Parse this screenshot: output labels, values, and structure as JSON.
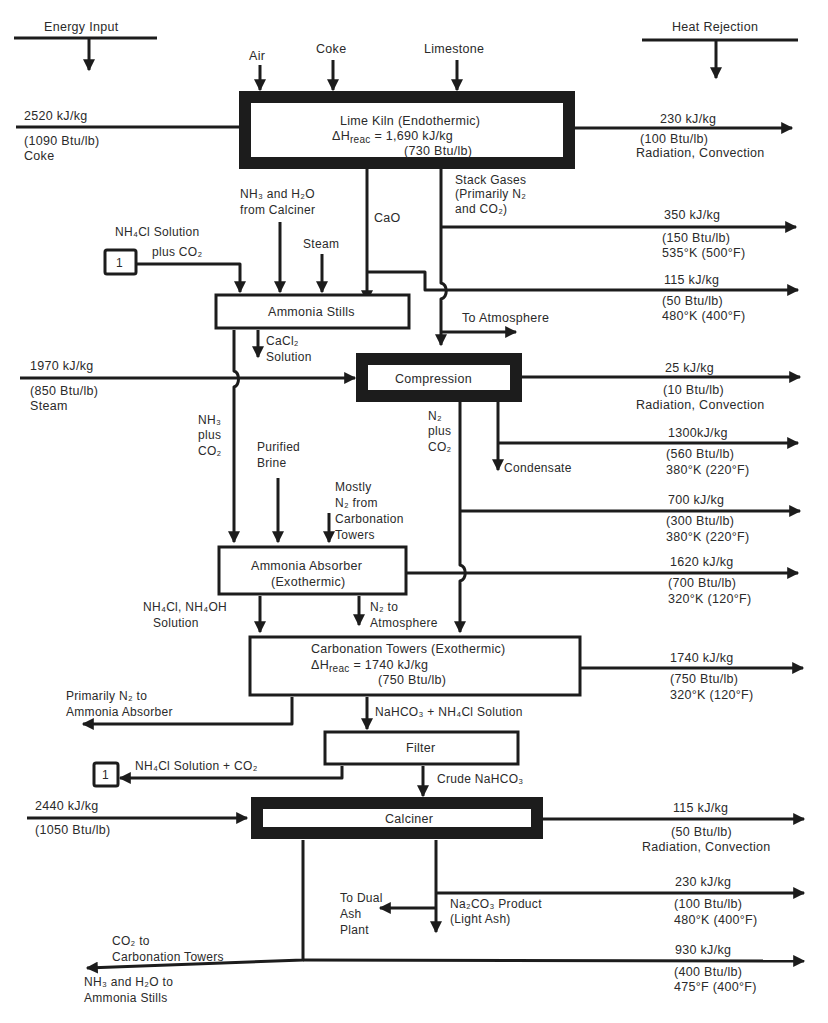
{
  "legend": {
    "energy_input": "Energy Input",
    "heat_rejection": "Heat Rejection"
  },
  "units": {
    "lime_kiln": {
      "title": "Lime Kiln (Endothermic)",
      "dh_prefix": "ΔH",
      "dh_sub": "reac",
      "dh_value": " = 1,690 kJ/kg",
      "dh_alt": "(730 Btu/lb)"
    },
    "ammonia_stills": {
      "title": "Ammonia Stills"
    },
    "compression": {
      "title": "Compression"
    },
    "ammonia_absorber": {
      "title": "Ammonia Absorber",
      "subtitle": "(Exothermic)"
    },
    "carbonation_towers": {
      "title": "Carbonation Towers (Exothermic)",
      "dh_prefix": "ΔH",
      "dh_sub": "reac",
      "dh_value": " = 1740 kJ/kg",
      "dh_alt": "(750 Btu/lb)"
    },
    "filter": {
      "title": "Filter"
    },
    "calciner": {
      "title": "Calciner"
    }
  },
  "inputs": {
    "air": "Air",
    "coke": "Coke",
    "limestone": "Limestone",
    "kiln_energy": {
      "kj": "2520 kJ/kg",
      "btu": "(1090 Btu/lb)",
      "source": "Coke"
    },
    "compression_energy": {
      "kj": "1970 kJ/kg",
      "btu": "(850 Btu/lb)",
      "source": "Steam"
    },
    "calciner_energy": {
      "kj": "2440 kJ/kg",
      "btu": "(1050 Btu/lb)"
    }
  },
  "streams": {
    "nh3_h2o_from_calciner": [
      "NH₃ and H₂O",
      "from Calciner"
    ],
    "cao": "CaO",
    "steam": "Steam",
    "nh4cl_plus_co2": [
      "NH₄Cl Solution",
      "plus CO₂"
    ],
    "stack_gases": [
      "Stack Gases",
      "(Primarily N₂",
      "and CO₂)"
    ],
    "to_atmosphere": "To Atmosphere",
    "cacl2_solution": [
      "CaCl₂",
      "Solution"
    ],
    "nh3_plus_co2": [
      "NH₃",
      "plus",
      "CO₂"
    ],
    "n2_plus_co2": [
      "N₂",
      "plus",
      "CO₂"
    ],
    "condensate": "Condensate",
    "purified_brine": [
      "Purified",
      "Brine"
    ],
    "mostly_n2": [
      "Mostly",
      "N₂ from",
      "Carbonation",
      "Towers"
    ],
    "nh4cl_nh4oh": [
      "NH₄Cl, NH₄OH",
      "Solution"
    ],
    "n2_to_atmosphere": [
      "N₂ to",
      "Atmosphere"
    ],
    "primarily_n2_to_absorber": [
      "Primarily N₂ to",
      "Ammonia Absorber"
    ],
    "nahco3_nh4cl": "NaHCO₃ + NH₄Cl Solution",
    "nh4cl_solution_co2": "NH₄Cl Solution + CO₂",
    "crude_nahco3": "Crude NaHCO₃",
    "to_dual_ash": [
      "To Dual",
      "Ash",
      "Plant"
    ],
    "na2co3_product": [
      "Na₂CO₃ Product",
      "(Light Ash)"
    ],
    "co2_to_carbonation": [
      "CO₂ to",
      "Carbonation Towers"
    ],
    "nh3_h2o_to_stills": [
      "NH₃ and H₂O to",
      "Ammonia Stills"
    ],
    "ref_marker": "1"
  },
  "heat_rejections": [
    {
      "kj": "230 kJ/kg",
      "btu": "(100 Btu/lb)",
      "detail": "Radiation, Convection"
    },
    {
      "kj": "350 kJ/kg",
      "btu": "(150 Btu/lb)",
      "detail": "535°K (500°F)"
    },
    {
      "kj": "115 kJ/kg",
      "btu": "(50 Btu/lb)",
      "detail": "480°K (400°F)"
    },
    {
      "kj": "25 kJ/kg",
      "btu": "(10 Btu/lb)",
      "detail": "Radiation, Convection"
    },
    {
      "kj": "1300kJ/kg",
      "btu": "(560 Btu/lb)",
      "detail": "380°K (220°F)"
    },
    {
      "kj": "700 kJ/kg",
      "btu": "(300 Btu/lb)",
      "detail": "380°K (220°F)"
    },
    {
      "kj": "1620 kJ/kg",
      "btu": "(700 Btu/lb)",
      "detail": "320°K (120°F)"
    },
    {
      "kj": "1740 kJ/kg",
      "btu": "(750 Btu/lb)",
      "detail": "320°K (120°F)"
    },
    {
      "kj": "115 kJ/kg",
      "btu": "(50 Btu/lb)",
      "detail": "Radiation, Convection"
    },
    {
      "kj": "230 kJ/kg",
      "btu": "(100 Btu/lb)",
      "detail": "480°K (400°F)"
    },
    {
      "kj": "930 kJ/kg",
      "btu": "(400 Btu/lb)",
      "detail": "475°F (400°F)"
    }
  ]
}
